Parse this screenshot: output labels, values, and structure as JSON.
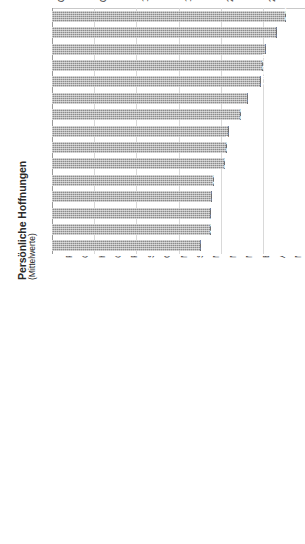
{
  "chart_data": {
    "type": "bar",
    "orientation": "vertical-rotated",
    "title": "Persönliche Hoffnungen",
    "subtitle": "(Mittelwerte)",
    "xlabel": "",
    "ylabel": "Persönliche Hoffnungen (Mittelwerte)",
    "ylim": [
      0.0,
      3.0
    ],
    "grid": true,
    "legend": "none",
    "tick_labels": [
      "0,00",
      "0,50",
      "1,00",
      "1,50",
      "2,00",
      "2,50",
      "3,00"
    ],
    "tick_values": [
      0.0,
      0.5,
      1.0,
      1.5,
      2.0,
      2.5,
      3.0
    ],
    "categories": [
      "Persönliche Gesundheit - 1",
      "Glückliche Ehe, Familie, Partnerschaft - 2",
      "Harmonie im Leben - 3",
      "Gute und vertrauensvolle Beziehungen - 4",
      "Persönliche Unabhängigkeit und Selbstbestimmung - 5",
      "Sinnvolle und erfüllende Aufgabe - 6",
      "Ordnung in meinem Leben - 7",
      "Mehr Spaß mit Freunden - 8",
      "Sicherer Arbeitsplatz - 9",
      "Mehr Zeit zur Entspannung - 10",
      "Mehr Freizeit - 11",
      "Mehr Sicherheit im persönlichen Umfeld - 12",
      "Erfolg am Arbeitsplatz, in der Ausbildung etc. - 13",
      "Anderen Menschen helfen können - 14",
      "Mehr Sex, romantische Erlebnisse - 15"
    ],
    "values": [
      2.77,
      2.67,
      2.54,
      2.5,
      2.48,
      2.33,
      2.24,
      2.1,
      2.07,
      2.05,
      1.92,
      1.9,
      1.89,
      1.88,
      1.77
    ],
    "value_labels": [
      "2,77",
      "2,67",
      "2,54",
      "2,50",
      "2,48",
      "2,33",
      "2,24",
      "2,10",
      "2,07",
      "2,05",
      "1,92",
      "1,90",
      "1,89",
      "1,88",
      "1,77"
    ],
    "colors": {
      "bar": "#8c8c8c",
      "bar_edge": "#6f6f6f",
      "gridline": "#d9d9d9",
      "axis": "#9a9a9a",
      "value_label": "#ffffff",
      "text": "#3c3c3c",
      "background": "#ffffff"
    }
  }
}
